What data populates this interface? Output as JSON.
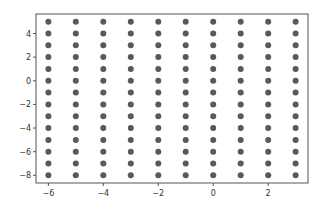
{
  "chart_data": {
    "type": "scatter",
    "title": "",
    "xlabel": "",
    "ylabel": "",
    "xlim": [
      -6.45,
      3.45
    ],
    "ylim": [
      -8.65,
      5.65
    ],
    "grid": false,
    "legend": null,
    "x_ticks": [
      -6,
      -4,
      -2,
      0,
      2
    ],
    "y_ticks": [
      -8,
      -6,
      -4,
      -2,
      0,
      2,
      4
    ],
    "x_values": [
      -6,
      -5,
      -4,
      -3,
      -2,
      -1,
      0,
      1,
      2,
      3
    ],
    "y_values": [
      5,
      4,
      3,
      2,
      1,
      0,
      -1,
      -2,
      -3,
      -4,
      -5,
      -6,
      -7,
      -8
    ],
    "point_color": "#595959"
  }
}
